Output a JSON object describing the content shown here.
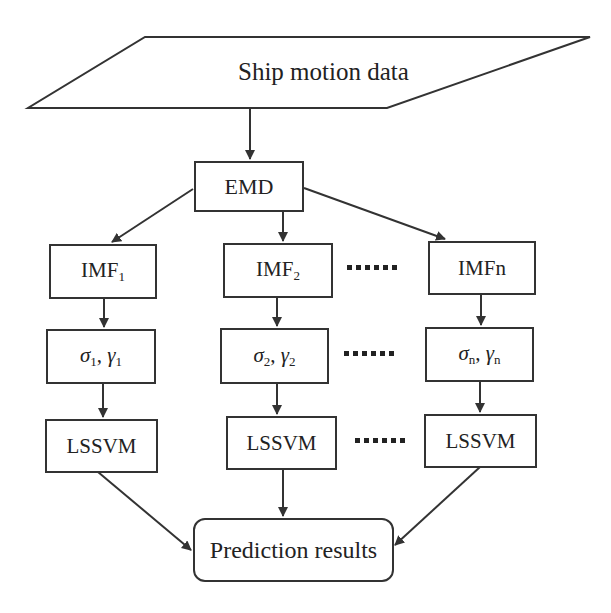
{
  "diagram": {
    "input": {
      "label": "Ship motion data",
      "shape": "parallelogram"
    },
    "decomposition": {
      "label": "EMD"
    },
    "branches": [
      {
        "imf_label": "IMF",
        "imf_sub": "1",
        "param_sigma": "σ",
        "param_sigma_sub": "1",
        "param_gamma": "γ",
        "param_gamma_sub": "1",
        "model_label": "LSSVM"
      },
      {
        "imf_label": "IMF",
        "imf_sub": "2",
        "param_sigma": "σ",
        "param_sigma_sub": "2",
        "param_gamma": "γ",
        "param_gamma_sub": "2",
        "model_label": "LSSVM"
      },
      {
        "imf_label": "IMFn",
        "imf_sub": "",
        "param_sigma": "σ",
        "param_sigma_sub": "n",
        "param_gamma": "γ",
        "param_gamma_sub": "n",
        "model_label": "LSSVM"
      }
    ],
    "ellipsis": "......",
    "output": {
      "label": "Prediction results",
      "shape": "rounded-rectangle"
    },
    "colors": {
      "stroke": "#333333",
      "text": "#222222",
      "background": "#ffffff"
    }
  }
}
